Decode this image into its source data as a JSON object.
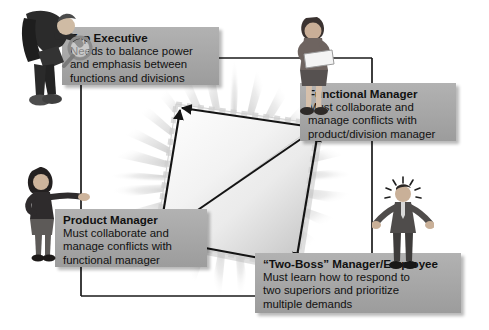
{
  "diagram": {
    "background_color": "#ffffff",
    "box_fill_color": "#a8a8a8",
    "line_color": "#1a1a1a",
    "boxes": [
      {
        "id": "top-executive",
        "title": "Top Executive",
        "lines": [
          "Needs to balance power",
          "and emphasis between",
          "functions and divisions"
        ]
      },
      {
        "id": "functional-manager",
        "title": "Functional Manager",
        "lines": [
          "Must collaborate and",
          "manage conflicts with",
          "product/division manager"
        ]
      },
      {
        "id": "product-manager",
        "title": "Product Manager",
        "lines": [
          "Must collaborate and",
          "manage conflicts with",
          "functional manager"
        ]
      },
      {
        "id": "two-boss-manager",
        "title": "“Two-Boss” Manager/Employee",
        "lines": [
          "Must learn how to respond to",
          "two superiors and prioritize",
          "multiple demands"
        ]
      }
    ],
    "figures": [
      {
        "id": "top-executive-figure",
        "description": "executive-with-magnifying-glass"
      },
      {
        "id": "functional-manager-figure",
        "description": "woman-holding-documents"
      },
      {
        "id": "product-manager-figure",
        "description": "woman-pointing"
      },
      {
        "id": "two-boss-figure",
        "description": "stressed-man-arms-out"
      }
    ],
    "center": {
      "shape": "tilted-square-with-diagonal",
      "rays": "radiating-starburst",
      "arrows": [
        "top-executive-to-functional-manager",
        "top-executive-to-product-manager",
        "product-manager-to-functional-manager",
        "product-manager-to-two-boss",
        "two-boss-to-functional-manager"
      ]
    },
    "connectors": [
      "top-executive-right-to-functional-manager",
      "top-executive-down-to-product-manager",
      "functional-manager-down-to-two-boss",
      "product-manager-down-to-two-boss"
    ]
  }
}
